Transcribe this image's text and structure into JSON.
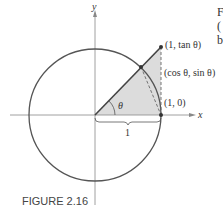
{
  "figure": {
    "caption": "FIGURE 2.16",
    "axis_x_label": "x",
    "axis_y_label": "y",
    "angle_label": "θ",
    "segment_label": "1",
    "points": [
      {
        "label": "(1, tan θ)"
      },
      {
        "label": "(cos θ, sin θ)"
      },
      {
        "label": "(1, 0)"
      }
    ],
    "edge_text": [
      "F",
      "(",
      "b"
    ],
    "colors": {
      "stroke": "#555555",
      "shade": "#dcdcdc",
      "axis": "#888888"
    }
  }
}
